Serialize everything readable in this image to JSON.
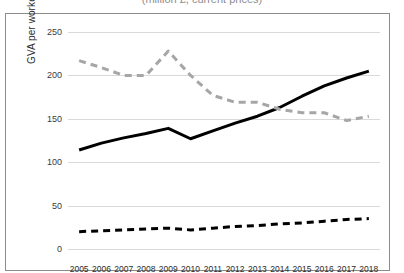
{
  "title": {
    "text": "(million £, current prices)",
    "visible_fragment": true
  },
  "axes": {
    "y_label": "GVA per worker",
    "y_ticks": [
      0,
      50,
      100,
      150,
      200,
      250
    ],
    "y_min": 0,
    "y_max": 250,
    "x_ticks": [
      "2005",
      "2006",
      "2007",
      "2008",
      "2009",
      "2010",
      "2011",
      "2012",
      "2013",
      "2014",
      "2015",
      "2016",
      "2017",
      "2018"
    ]
  },
  "colors": {
    "solid_line": "#000000",
    "dashed_gray_line": "#a6a6a6",
    "dashed_black_line": "#000000",
    "gridline": "#d9d9d9",
    "frame": "#8c8c8c",
    "background": "#ffffff",
    "text": "#2b2b2b"
  },
  "chart_data": {
    "type": "line",
    "title": "(million £, current prices)",
    "xlabel": "",
    "ylabel": "GVA per worker",
    "ylim": [
      0,
      250
    ],
    "ytick_step": 50,
    "grid": true,
    "legend": "none",
    "categories": [
      "2005",
      "2006",
      "2007",
      "2008",
      "2009",
      "2010",
      "2011",
      "2012",
      "2013",
      "2014",
      "2015",
      "2016",
      "2017",
      "2018"
    ],
    "series": [
      {
        "name": "series-solid-black",
        "style": "solid",
        "color": "#000000",
        "width": 3,
        "values": [
          114,
          122,
          128,
          133,
          139,
          127,
          136,
          145,
          153,
          163,
          176,
          188,
          197,
          205
        ]
      },
      {
        "name": "series-dashed-gray",
        "style": "dashed",
        "color": "#a6a6a6",
        "width": 3,
        "values": [
          217,
          209,
          200,
          200,
          228,
          200,
          177,
          169,
          169,
          161,
          157,
          157,
          148,
          153
        ]
      },
      {
        "name": "series-dashed-black",
        "style": "dashed",
        "color": "#000000",
        "width": 3,
        "values": [
          20,
          21,
          22,
          23,
          24,
          22,
          24,
          26,
          27,
          29,
          30,
          32,
          34,
          35
        ]
      }
    ]
  }
}
